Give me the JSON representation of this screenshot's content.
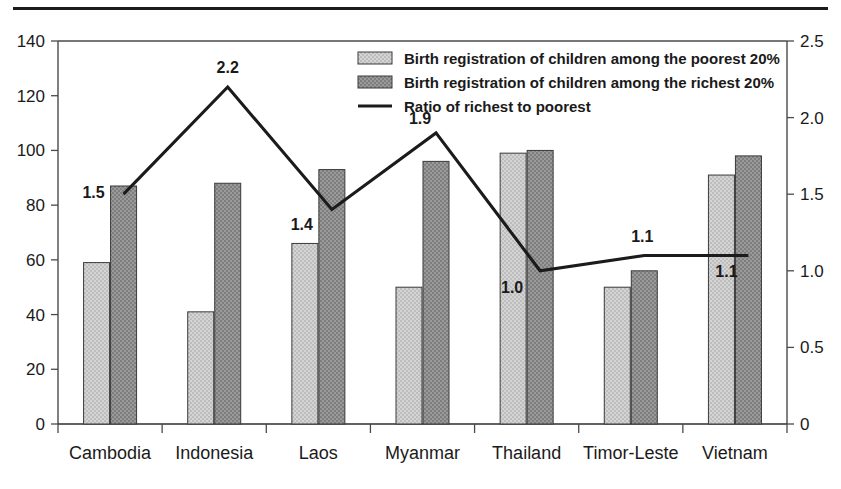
{
  "chart_data": {
    "type": "bar",
    "title": "",
    "subtitle": "",
    "xlabel": "",
    "ylabel": "",
    "categories": [
      "Cambodia",
      "Indonesia",
      "Laos",
      "Myanmar",
      "Thailand",
      "Timor-Leste",
      "Vietnam"
    ],
    "series": [
      {
        "name": "Birth registration of children among the poorest 20%",
        "type": "bar",
        "axis": "left",
        "values": [
          59,
          41,
          66,
          50,
          99,
          50,
          91
        ],
        "color": "#c9c9c9"
      },
      {
        "name": "Birth registration of children among the richest 20%",
        "type": "bar",
        "axis": "left",
        "values": [
          87,
          88,
          93,
          96,
          100,
          56,
          98
        ],
        "color": "#8f8f8f"
      },
      {
        "name": "Ratio of richest to poorest",
        "type": "line",
        "axis": "right",
        "values": [
          1.5,
          2.2,
          1.4,
          1.9,
          1.0,
          1.1,
          1.1
        ],
        "labels": [
          "1.5",
          "2.2",
          "1.4",
          "1.9",
          "1.0",
          "1.1",
          "1.1"
        ],
        "color": "#1b1b1b"
      }
    ],
    "left_axis": {
      "ticks": [
        0,
        20,
        40,
        60,
        80,
        100,
        120,
        140
      ],
      "tick_labels": [
        "0",
        "20",
        "40",
        "60",
        "80",
        "100",
        "120",
        "140"
      ],
      "ylim": [
        0,
        140
      ]
    },
    "right_axis": {
      "ticks": [
        0,
        0.5,
        1.0,
        1.5,
        2.0,
        2.5
      ],
      "tick_labels": [
        "0",
        "0.5",
        "1.0",
        "1.5",
        "2.0",
        "2.5"
      ],
      "ylim": [
        0,
        2.5
      ]
    },
    "grid": false,
    "legend_position": "top-right"
  },
  "legend": {
    "items": [
      {
        "label": "Birth registration of children among the poorest 20%",
        "marker": "swatch-light"
      },
      {
        "label": "Birth registration of children among the richest 20%",
        "marker": "swatch-dark"
      },
      {
        "label": "Ratio of richest to poorest",
        "marker": "line"
      }
    ]
  },
  "colors": {
    "bar_light": "#c9c9c9",
    "bar_dark": "#8f8f8f",
    "line": "#1b1b1b",
    "axis": "#4a4a4a",
    "text": "#1a1a1a",
    "background": "#ffffff"
  }
}
